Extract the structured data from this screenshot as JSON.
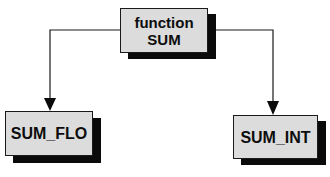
{
  "diagram": {
    "type": "hierarchy",
    "root": {
      "line1": "function",
      "line2": "SUM"
    },
    "children": [
      {
        "label": "SUM_FLO"
      },
      {
        "label": "SUM_INT"
      }
    ],
    "edges": [
      {
        "from": "function SUM",
        "to": "SUM_FLO"
      },
      {
        "from": "function SUM",
        "to": "SUM_INT"
      }
    ],
    "colors": {
      "box_fill": "#dcdcdc",
      "shadow": "#0a0a0a",
      "line": "#1a1a1a",
      "text": "#0d0d0d"
    }
  }
}
